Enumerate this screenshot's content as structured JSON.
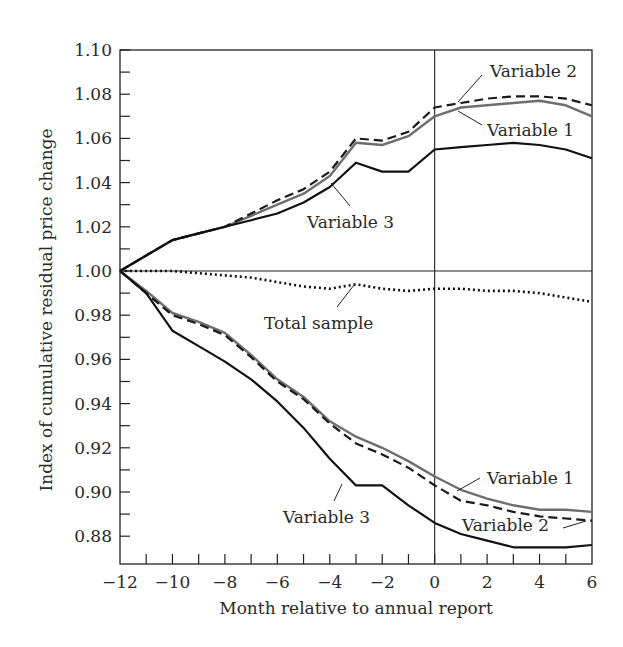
{
  "chart_data": {
    "type": "line",
    "title": "",
    "xlabel": "Month relative to annual report",
    "ylabel": "Index of cumulative residual price change",
    "xlim": [
      -12,
      6
    ],
    "ylim": [
      0.87,
      1.1
    ],
    "x_ticks": [
      -12,
      -10,
      -8,
      -6,
      -4,
      -2,
      0,
      2,
      4,
      6
    ],
    "x_tick_labels": [
      "−12",
      "−10",
      "−8",
      "−6",
      "−4",
      "−2",
      "0",
      "2",
      "4",
      "6"
    ],
    "y_ticks": [
      0.88,
      0.9,
      0.92,
      0.94,
      0.96,
      0.98,
      1.0,
      1.02,
      1.04,
      1.06,
      1.08,
      1.1
    ],
    "y_tick_labels": [
      "0.88",
      "0.90",
      "0.92",
      "0.94",
      "0.96",
      "0.98",
      "1.00",
      "1.02",
      "1.04",
      "1.06",
      "1.08",
      "1.10"
    ],
    "grid": false,
    "reference_lines": [
      {
        "orientation": "horizontal",
        "value": 1.0
      },
      {
        "orientation": "vertical",
        "value": 0
      }
    ],
    "legend": "none (inline annotations)",
    "x": [
      -12,
      -11,
      -10,
      -9,
      -8,
      -7,
      -6,
      -5,
      -4,
      -3,
      -2,
      -1,
      0,
      1,
      2,
      3,
      4,
      5,
      6
    ],
    "series": [
      {
        "name": "Variable 1 (good news)",
        "style": "solid-gray",
        "color": "#6e6e6e",
        "values": [
          1.0,
          1.007,
          1.014,
          1.017,
          1.02,
          1.025,
          1.03,
          1.035,
          1.043,
          1.058,
          1.057,
          1.061,
          1.07,
          1.074,
          1.075,
          1.076,
          1.077,
          1.075,
          1.07
        ]
      },
      {
        "name": "Variable 2 (good news)",
        "style": "dashed",
        "color": "#1a1a1a",
        "values": [
          1.0,
          1.007,
          1.014,
          1.017,
          1.02,
          1.026,
          1.032,
          1.037,
          1.045,
          1.06,
          1.059,
          1.063,
          1.074,
          1.076,
          1.078,
          1.079,
          1.079,
          1.078,
          1.075
        ]
      },
      {
        "name": "Variable 3 (good news)",
        "style": "solid-black",
        "color": "#111111",
        "values": [
          1.0,
          1.007,
          1.014,
          1.017,
          1.02,
          1.023,
          1.026,
          1.031,
          1.038,
          1.049,
          1.045,
          1.045,
          1.055,
          1.056,
          1.057,
          1.058,
          1.057,
          1.055,
          1.051
        ]
      },
      {
        "name": "Total sample",
        "style": "dotted",
        "color": "#111111",
        "values": [
          1.0,
          1.0,
          1.0,
          0.999,
          0.998,
          0.997,
          0.995,
          0.993,
          0.992,
          0.994,
          0.992,
          0.991,
          0.992,
          0.992,
          0.991,
          0.991,
          0.99,
          0.988,
          0.986
        ]
      },
      {
        "name": "Variable 1 (bad news)",
        "style": "solid-gray",
        "color": "#6e6e6e",
        "values": [
          1.0,
          0.991,
          0.981,
          0.977,
          0.972,
          0.962,
          0.951,
          0.943,
          0.932,
          0.925,
          0.92,
          0.914,
          0.907,
          0.901,
          0.897,
          0.894,
          0.892,
          0.892,
          0.891
        ]
      },
      {
        "name": "Variable 2 (bad news)",
        "style": "dashed",
        "color": "#1a1a1a",
        "values": [
          1.0,
          0.99,
          0.98,
          0.976,
          0.971,
          0.961,
          0.95,
          0.942,
          0.931,
          0.922,
          0.917,
          0.911,
          0.903,
          0.896,
          0.894,
          0.891,
          0.889,
          0.888,
          0.887
        ]
      },
      {
        "name": "Variable 3 (bad news)",
        "style": "solid-black",
        "color": "#111111",
        "values": [
          1.0,
          0.99,
          0.973,
          0.966,
          0.959,
          0.951,
          0.941,
          0.929,
          0.915,
          0.903,
          0.903,
          0.894,
          0.886,
          0.881,
          0.878,
          0.875,
          0.875,
          0.875,
          0.876
        ]
      }
    ],
    "annotations": [
      {
        "text": "Variable 2",
        "target": "Variable 2 (good news)"
      },
      {
        "text": "Variable 1",
        "target": "Variable 1 (good news)"
      },
      {
        "text": "Variable 3",
        "target": "Variable 3 (good news)"
      },
      {
        "text": "Total sample",
        "target": "Total sample"
      },
      {
        "text": "Variable 1",
        "target": "Variable 1 (bad news)"
      },
      {
        "text": "Variable 3",
        "target": "Variable 3 (bad news)"
      },
      {
        "text": "Variable 2",
        "target": "Variable 2 (bad news)"
      }
    ]
  }
}
